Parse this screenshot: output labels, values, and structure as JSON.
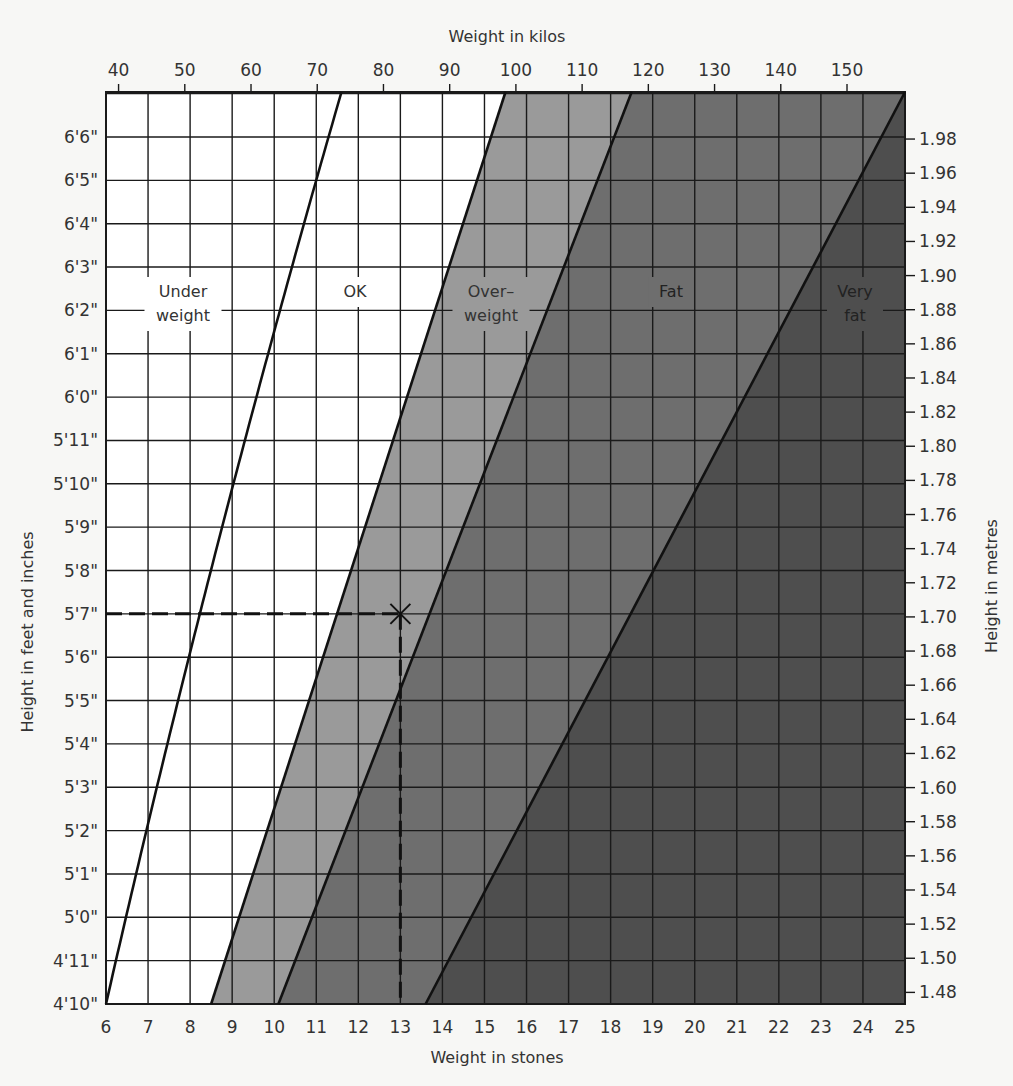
{
  "chart_data": {
    "type": "area",
    "top_axis": {
      "label": "Weight in kilos",
      "ticks": [
        40,
        50,
        60,
        70,
        80,
        90,
        100,
        110,
        120,
        130,
        140,
        150
      ]
    },
    "bottom_axis": {
      "label": "Weight in stones",
      "ticks": [
        6,
        7,
        8,
        9,
        10,
        11,
        12,
        13,
        14,
        15,
        16,
        17,
        18,
        19,
        20,
        21,
        22,
        23,
        24,
        25
      ],
      "range": [
        6,
        25
      ]
    },
    "left_axis": {
      "label": "Height in feet and inches",
      "ticks": [
        "4'10\"",
        "4'11\"",
        "5'0\"",
        "5'1\"",
        "5'2\"",
        "5'3\"",
        "5'4\"",
        "5'5\"",
        "5'6\"",
        "5'7\"",
        "5'8\"",
        "5'9\"",
        "5'10\"",
        "5'11\"",
        "6'0\"",
        "6'1\"",
        "6'2\"",
        "6'3\"",
        "6'4\"",
        "6'5\"",
        "6'6\""
      ]
    },
    "right_axis": {
      "label": "Height in metres",
      "ticks": [
        "1.48",
        "1.50",
        "1.52",
        "1.54",
        "1.56",
        "1.58",
        "1.60",
        "1.62",
        "1.64",
        "1.66",
        "1.68",
        "1.70",
        "1.72",
        "1.74",
        "1.76",
        "1.78",
        "1.80",
        "1.82",
        "1.84",
        "1.86",
        "1.88",
        "1.90",
        "1.92",
        "1.94",
        "1.96",
        "1.98"
      ]
    },
    "regions": [
      {
        "name": "Underweight",
        "label_lines": [
          "Under",
          "weight"
        ],
        "color": "#ffffff"
      },
      {
        "name": "OK",
        "label_lines": [
          "OK"
        ],
        "color": "#ffffff"
      },
      {
        "name": "Overweight",
        "label_lines": [
          "Over–",
          "weight"
        ],
        "color": "#9a9a9a"
      },
      {
        "name": "Fat",
        "label_lines": [
          "Fat"
        ],
        "color": "#6e6e6e"
      },
      {
        "name": "Very fat",
        "label_lines": [
          "Very",
          "fat"
        ],
        "color": "#4e4e4e"
      }
    ],
    "boundaries_stones": [
      {
        "between": "Underweight/OK",
        "at_4ft10": 6.0,
        "at_6ft7": 11.6,
        "curved": true
      },
      {
        "between": "OK/Overweight",
        "at_4ft10": 8.5,
        "at_6ft7": 15.5
      },
      {
        "between": "Overweight/Fat",
        "at_4ft10": 10.1,
        "at_6ft7": 18.5
      },
      {
        "between": "Fat/Very fat",
        "at_4ft10": 13.6,
        "at_6ft7": 25.0
      }
    ],
    "example_point": {
      "stones": 13,
      "height": "5'7\"",
      "marker": "x",
      "guide_lines": "dashed"
    },
    "grid": true
  }
}
